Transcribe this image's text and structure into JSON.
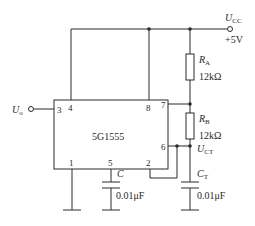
{
  "diagram": {
    "type": "555 timer circuit schematic",
    "chip": {
      "label": "5G1555",
      "pins": {
        "p1": "1",
        "p2": "2",
        "p3": "3",
        "p4": "4",
        "p5": "5",
        "p6": "6",
        "p7": "7",
        "p8": "8"
      }
    },
    "supply": {
      "symbol": "U",
      "sub": "CC",
      "value": "+5V"
    },
    "output": {
      "symbol": "U",
      "sub": "o"
    },
    "resistors": [
      {
        "symbol": "R",
        "sub": "A",
        "value": "12kΩ"
      },
      {
        "symbol": "R",
        "sub": "B",
        "value": "12kΩ"
      }
    ],
    "capacitors": [
      {
        "symbol": "C",
        "sub": "",
        "value": "0.01μF"
      },
      {
        "symbol": "C",
        "sub": "T",
        "value": "0.01μF"
      }
    ],
    "node_ct": {
      "symbol": "U",
      "sub": "CT"
    },
    "colors": {
      "line": "#2a2a2a",
      "background": "#ffffff"
    }
  }
}
